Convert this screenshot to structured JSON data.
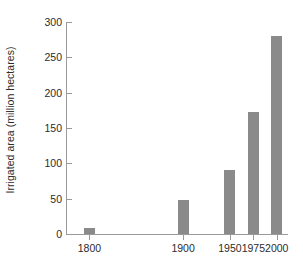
{
  "chart_data": {
    "type": "bar",
    "title": "",
    "subtitle": "",
    "xlabel": "",
    "ylabel": "Irrigated area (million hectares)",
    "categories": [
      "1800",
      "1900",
      "1950",
      "1975",
      "2000"
    ],
    "x": [
      1800,
      1900,
      1950,
      1975,
      2000
    ],
    "values": [
      8,
      48,
      91,
      172,
      280
    ],
    "series": [
      {
        "name": "Irrigated area",
        "values": [
          8,
          48,
          91,
          172,
          280
        ],
        "color": "#8a8a8a"
      }
    ],
    "ylim": [
      0,
      300
    ],
    "yticks": [
      0,
      50,
      100,
      150,
      200,
      250,
      300
    ],
    "ytick_labels": [
      "0",
      "50",
      "100",
      "150",
      "200",
      "250",
      "300"
    ],
    "xticks": [
      1800,
      1900,
      1950,
      1975,
      2000
    ],
    "xtick_labels": [
      "1800",
      "1900",
      "1950",
      "1975",
      "2000"
    ],
    "xlim": [
      1775,
      2012
    ],
    "grid": false,
    "legend": false,
    "legend_position": "none",
    "background": "#ffffff",
    "axis_color": "#9a9a9a",
    "text_color": "#2b2b2b",
    "annotations": []
  },
  "axes": {
    "y_title": "Irrigated area (million hectares)",
    "tick_color": "#9a9a9a"
  }
}
